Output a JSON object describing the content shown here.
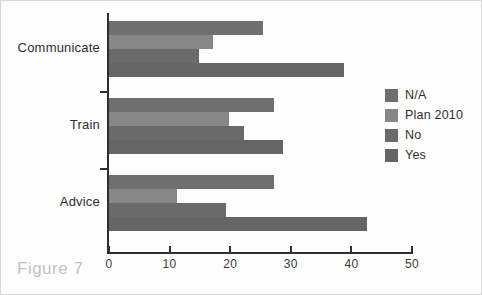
{
  "caption": "Figure 7",
  "chart_data": {
    "type": "bar",
    "orientation": "horizontal",
    "title": "",
    "xlabel": "",
    "ylabel": "",
    "xlim": [
      0,
      50
    ],
    "xticks": [
      0,
      10,
      20,
      30,
      40,
      50
    ],
    "xtick_labels": [
      "0",
      "10",
      "20",
      "30",
      "40",
      "50"
    ],
    "grid": false,
    "legend_position": "right",
    "categories": [
      "Communicate",
      "Train",
      "Advice"
    ],
    "series": [
      {
        "name": "N/A",
        "color": "#6f6f6f",
        "values": [
          25.4,
          27.2,
          27.3
        ]
      },
      {
        "name": "Plan 2010",
        "color": "#878787",
        "values": [
          17.2,
          19.8,
          11.2
        ]
      },
      {
        "name": "No",
        "color": "#6a6a6a",
        "values": [
          14.8,
          22.2,
          19.3
        ]
      },
      {
        "name": "Yes",
        "color": "#656565",
        "values": [
          38.8,
          28.7,
          42.6
        ]
      }
    ]
  },
  "legend": {
    "items": [
      {
        "label": "N/A",
        "color": "#6f6f6f"
      },
      {
        "label": "Plan 2010",
        "color": "#878787"
      },
      {
        "label": "No",
        "color": "#6a6a6a"
      },
      {
        "label": "Yes",
        "color": "#656565"
      }
    ]
  }
}
